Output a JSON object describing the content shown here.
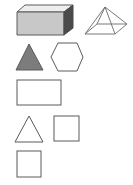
{
  "diagram": {
    "title": "",
    "colors": {
      "stroke": "#5a5a5a",
      "cuboid_front": "#c8c8c8",
      "cuboid_top": "#eeeeee",
      "cuboid_side": "#4a4a4a",
      "triangle_fill": "#7c7c7c",
      "background": "#ffffff"
    },
    "shapes": [
      {
        "id": "cuboid",
        "type": "3d-cuboid",
        "filled": true
      },
      {
        "id": "pyramid",
        "type": "3d-square-pyramid",
        "filled": false
      },
      {
        "id": "filled-triangle",
        "type": "triangle",
        "filled": true
      },
      {
        "id": "hexagon",
        "type": "hexagon",
        "filled": false
      },
      {
        "id": "rectangle",
        "type": "rectangle",
        "filled": false
      },
      {
        "id": "outline-triangle",
        "type": "triangle",
        "filled": false
      },
      {
        "id": "square-right",
        "type": "square",
        "filled": false
      },
      {
        "id": "square-bottom",
        "type": "square",
        "filled": false
      }
    ]
  }
}
